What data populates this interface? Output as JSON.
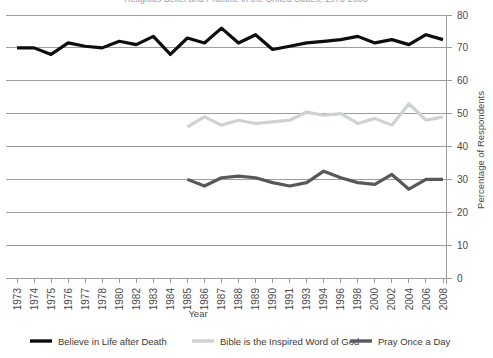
{
  "chart_data": {
    "type": "line",
    "title": "Religious Belief and Practice in the United States, 1973-2008",
    "xlabel": "Year",
    "ylabel": "Percentage of Respondents",
    "ylim": [
      0,
      80
    ],
    "ytick_step": 10,
    "yticks": [
      0,
      10,
      20,
      30,
      40,
      50,
      60,
      70,
      80
    ],
    "grid": true,
    "legend_position": "bottom",
    "categories": [
      "1973",
      "1974",
      "1975",
      "1976",
      "1977",
      "1978",
      "1980",
      "1982",
      "1983",
      "1984",
      "1985",
      "1986",
      "1987",
      "1988",
      "1989",
      "1990",
      "1991",
      "1993",
      "1994",
      "1996",
      "1998",
      "2000",
      "2002",
      "2004",
      "2006",
      "2008"
    ],
    "series": [
      {
        "name": "Believe in Life after Death",
        "color": "#0d0d0d",
        "width": 3.2,
        "values": [
          70.0,
          70.0,
          68.0,
          71.5,
          70.5,
          70.0,
          72.0,
          71.0,
          73.5,
          68.0,
          73.0,
          71.5,
          76.0,
          71.5,
          74.0,
          69.5,
          70.5,
          71.5,
          72.0,
          72.5,
          73.5,
          71.5,
          72.5,
          71.0,
          74.0,
          72.5
        ]
      },
      {
        "name": "Bible is the Inspired Word of God",
        "color": "#cfd2d2",
        "width": 3.2,
        "values": [
          null,
          null,
          null,
          null,
          null,
          null,
          null,
          null,
          null,
          null,
          46.0,
          49.0,
          46.5,
          48.0,
          47.0,
          47.5,
          48.0,
          50.5,
          49.5,
          50.0,
          47.0,
          48.5,
          46.5,
          53.0,
          48.0,
          49.0
        ]
      },
      {
        "name": "Pray Once a Day",
        "color": "#585858",
        "width": 3.2,
        "values": [
          null,
          null,
          null,
          null,
          null,
          null,
          null,
          null,
          null,
          null,
          30.0,
          28.0,
          30.5,
          31.0,
          30.5,
          29.0,
          28.0,
          29.0,
          32.5,
          30.5,
          29.0,
          28.5,
          31.5,
          27.0,
          30.0,
          30.0
        ]
      }
    ]
  },
  "legend": {
    "items": [
      {
        "label": "Believe in Life after Death",
        "color": "#0d0d0d"
      },
      {
        "label": "Bible is the Inspired Word of God",
        "color": "#cfd2d2"
      },
      {
        "label": "Pray Once a Day",
        "color": "#585858"
      }
    ]
  }
}
